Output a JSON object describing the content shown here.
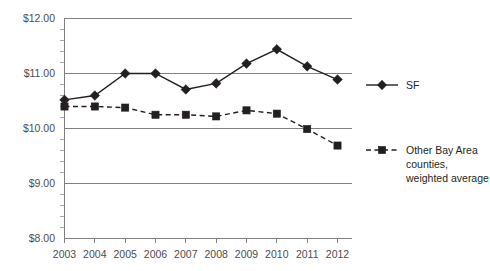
{
  "chart_data": {
    "type": "line",
    "title": "",
    "subtitle": "",
    "xlabel": "",
    "ylabel": "",
    "categories": [
      "2003",
      "2004",
      "2005",
      "2006",
      "2007",
      "2008",
      "2009",
      "2010",
      "2011",
      "2012"
    ],
    "x": [
      2003,
      2004,
      2005,
      2006,
      2007,
      2008,
      2009,
      2010,
      2011,
      2012
    ],
    "series": [
      {
        "name": "SF",
        "marker": "diamond",
        "linestyle": "solid",
        "color": "#231f20",
        "values": [
          10.52,
          10.6,
          11.0,
          11.0,
          10.71,
          10.82,
          11.18,
          11.44,
          11.13,
          10.89
        ]
      },
      {
        "name": "Other Bay Area counties, weighted average",
        "marker": "square",
        "linestyle": "dashed",
        "color": "#231f20",
        "values": [
          10.4,
          10.4,
          10.38,
          10.25,
          10.25,
          10.22,
          10.33,
          10.27,
          9.99,
          9.69
        ]
      }
    ],
    "ylim": [
      8.0,
      12.0
    ],
    "yticks": [
      8.0,
      9.0,
      10.0,
      11.0,
      12.0
    ],
    "ytick_labels": [
      "$8.00",
      "$9.00",
      "$10.00",
      "$11.00",
      "$12.00"
    ],
    "yminor_count": 5,
    "grid": true,
    "grid_axis": "y",
    "legend_position": "right"
  },
  "axis": {
    "y_labels": [
      "$12.00",
      "$11.00",
      "$10.00",
      "$9.00",
      "$8.00"
    ],
    "x_labels": [
      "2003",
      "2004",
      "2005",
      "2006",
      "2007",
      "2008",
      "2009",
      "2010",
      "2011",
      "2012"
    ]
  },
  "legend": {
    "entries": [
      {
        "label": "SF",
        "lines": [
          "SF"
        ]
      },
      {
        "label": "Other Bay Area counties, weighted average",
        "lines": [
          "Other Bay Area",
          "counties,",
          "weighted average"
        ]
      }
    ]
  },
  "colors": {
    "ink": "#231f20",
    "grid": "#808080",
    "tick_text": "#4d4d4d",
    "background": "#ffffff"
  }
}
